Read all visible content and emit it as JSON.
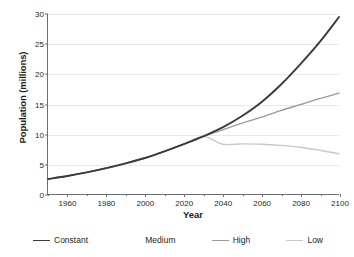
{
  "chart_data": {
    "type": "line",
    "title": "",
    "xlabel": "Year",
    "ylabel": "Population (millions)",
    "xlim": [
      1950,
      2100
    ],
    "ylim": [
      0,
      30
    ],
    "grid": true,
    "legend_position": "bottom",
    "x_ticks": [
      1960,
      1980,
      2000,
      2020,
      2040,
      2060,
      2080,
      2100
    ],
    "x_minor_ticks": [
      1950,
      1970,
      1990,
      2010,
      2030,
      2050,
      2070,
      2090
    ],
    "y_ticks": [
      0,
      5,
      10,
      15,
      20,
      25,
      30
    ],
    "x": [
      1950,
      1960,
      1970,
      1980,
      1990,
      2000,
      2010,
      2020,
      2030,
      2040,
      2050,
      2060,
      2070,
      2080,
      2090,
      2100
    ],
    "series": [
      {
        "name": "Constant",
        "color": "#3a3a3c",
        "width": 1.9,
        "values": [
          2.5,
          3.0,
          3.6,
          4.3,
          5.1,
          6.0,
          7.1,
          8.3,
          9.6,
          11.1,
          13.0,
          15.3,
          18.2,
          21.6,
          25.3,
          29.5
        ]
      },
      {
        "name": "Medium",
        "color": "#ffffff",
        "width": 1.2,
        "values": [
          2.5,
          3.0,
          3.6,
          4.3,
          5.1,
          6.0,
          7.1,
          8.3,
          9.6,
          10.6,
          11.5,
          12.2,
          12.8,
          13.2,
          13.5,
          13.6
        ]
      },
      {
        "name": "High",
        "color": "#9a9a9c",
        "width": 1.4,
        "values": [
          2.5,
          3.0,
          3.6,
          4.3,
          5.1,
          6.0,
          7.1,
          8.3,
          9.6,
          10.7,
          11.8,
          12.8,
          13.9,
          14.9,
          15.9,
          16.8
        ]
      },
      {
        "name": "Low",
        "color": "#c8c8ca",
        "width": 1.4,
        "values": [
          2.5,
          3.0,
          3.6,
          4.3,
          5.1,
          6.0,
          7.1,
          8.3,
          9.6,
          8.3,
          8.35,
          8.3,
          8.1,
          7.8,
          7.3,
          6.7
        ]
      }
    ],
    "legend": [
      {
        "label": "Constant",
        "color": "#3a3a3c",
        "width": 1.9,
        "show_swatch": true
      },
      {
        "label": "Medium",
        "color": "#ffffff",
        "width": 1.2,
        "show_swatch": false
      },
      {
        "label": "High",
        "color": "#9a9a9c",
        "width": 1.4,
        "show_swatch": true
      },
      {
        "label": "Low",
        "color": "#c8c8ca",
        "width": 1.4,
        "show_swatch": true
      }
    ],
    "colors": {
      "axis": "#6d6e71",
      "grid": "#e8e8e8",
      "text": "#231f20",
      "background": "#ffffff"
    }
  }
}
